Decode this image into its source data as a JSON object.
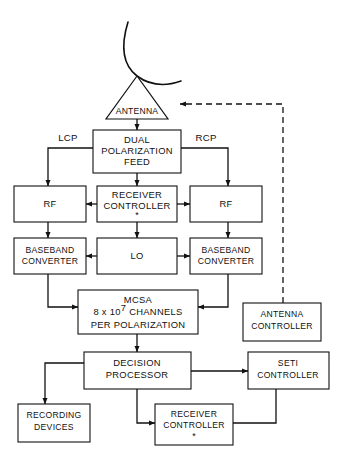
{
  "diagram": {
    "background_color": "#ffffff",
    "line_color": "#111111",
    "antenna": {
      "label": "ANTENNA",
      "dish_icon": "parabolic-dish-icon"
    },
    "nodes": {
      "dual_polarization_feed": {
        "line1": "DUAL",
        "line2": "POLARIZATION",
        "line3": "FEED"
      },
      "rf_left": {
        "label": "RF"
      },
      "rf_right": {
        "label": "RF"
      },
      "receiver_controller_top": {
        "line1": "RECEIVER",
        "line2": "CONTROLLER",
        "marker": "*"
      },
      "baseband_converter_left": {
        "line1": "BASEBAND",
        "line2": "CONVERTER"
      },
      "baseband_converter_right": {
        "line1": "BASEBAND",
        "line2": "CONVERTER"
      },
      "lo": {
        "label": "LO"
      },
      "mcsa": {
        "line1": "MCSA",
        "line2_pre": "8 x 10",
        "line2_sup": "7",
        "line2_post": "CHANNELS",
        "line3": "PER POLARIZATION"
      },
      "antenna_controller": {
        "line1": "ANTENNA",
        "line2": "CONTROLLER"
      },
      "decision_processor": {
        "line1": "DECISION",
        "line2": "PROCESSOR"
      },
      "seti_controller": {
        "line1": "SETI",
        "line2": "CONTROLLER"
      },
      "recording_devices": {
        "line1": "RECORDING",
        "line2": "DEVICES"
      },
      "receiver_controller_bottom": {
        "line1": "RECEIVER",
        "line2": "CONTROLLER",
        "marker": "*"
      }
    },
    "edge_labels": {
      "lcp": "LCP",
      "rcp": "RCP"
    }
  }
}
